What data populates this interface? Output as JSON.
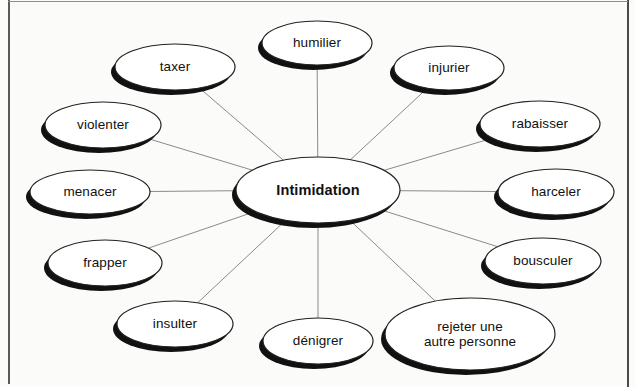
{
  "document": {
    "type": "concept-map",
    "title_node": "Intimidation",
    "language": "fr",
    "background_color": "#fbfbfa",
    "frame_color": "#4a4a4a"
  },
  "diagram": {
    "center": {
      "label": "Intimidation",
      "cx": 318,
      "cy": 190,
      "rx": 82,
      "ry": 33,
      "bold": true
    },
    "nodes": [
      {
        "id": "humilier",
        "label": "humilier",
        "cx": 317,
        "cy": 43,
        "rx": 55,
        "ry": 22
      },
      {
        "id": "injurier",
        "label": "injurier",
        "cx": 449,
        "cy": 68,
        "rx": 55,
        "ry": 22
      },
      {
        "id": "rabaisser",
        "label": "rabaisser",
        "cx": 540,
        "cy": 124,
        "rx": 60,
        "ry": 23
      },
      {
        "id": "harceler",
        "label": "harceler",
        "cx": 556,
        "cy": 192,
        "rx": 58,
        "ry": 23
      },
      {
        "id": "bousculer",
        "label": "bousculer",
        "cx": 543,
        "cy": 261,
        "rx": 58,
        "ry": 23
      },
      {
        "id": "rejeter",
        "label": "rejeter une\nautre personne",
        "cx": 470,
        "cy": 334,
        "rx": 85,
        "ry": 36
      },
      {
        "id": "denigrer",
        "label": "dénigrer",
        "cx": 318,
        "cy": 341,
        "rx": 55,
        "ry": 23
      },
      {
        "id": "insulter",
        "label": "insulter",
        "cx": 175,
        "cy": 324,
        "rx": 58,
        "ry": 23
      },
      {
        "id": "frapper",
        "label": "frapper",
        "cx": 105,
        "cy": 263,
        "rx": 57,
        "ry": 23
      },
      {
        "id": "menacer",
        "label": "menacer",
        "cx": 90,
        "cy": 192,
        "rx": 60,
        "ry": 22
      },
      {
        "id": "violenter",
        "label": "violenter",
        "cx": 103,
        "cy": 125,
        "rx": 58,
        "ry": 23
      },
      {
        "id": "taxer",
        "label": "taxer",
        "cx": 175,
        "cy": 67,
        "rx": 60,
        "ry": 23
      }
    ],
    "style": {
      "ellipse_fill": "#ffffff",
      "ellipse_stroke": "#222222",
      "ellipse_stroke_width": 1.2,
      "shadow_color": "#111111",
      "connector_color": "#8a8a8a",
      "connector_width": 1
    }
  }
}
